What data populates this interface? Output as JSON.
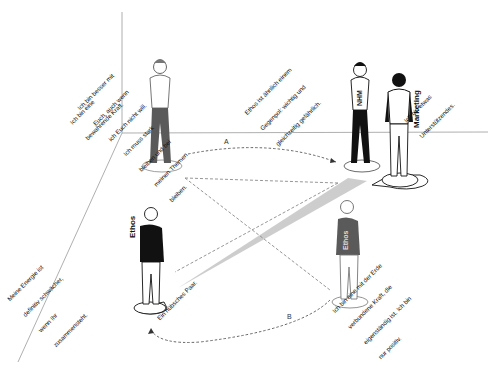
{
  "diagram": {
    "type": "systemic constellation (Aufstellung) with figures on a floor",
    "colors": {
      "background": "#ffffff",
      "room_lines": "#9a9a9a",
      "dashed_lines": "#8a8a8a",
      "gaze_beam": "#c8c8c8",
      "figure_dark": "#111111",
      "figure_grey": "#5a5a5a"
    },
    "figures": [
      {
        "id": "nhm-left",
        "shirt_label": "NHM",
        "color": "grey"
      },
      {
        "id": "nhm-right",
        "shirt_label": "NHM",
        "color": "black"
      },
      {
        "id": "marketing",
        "side_label": "Marketing",
        "color": "black-white"
      },
      {
        "id": "ethos-left",
        "side_label": "Ethos",
        "color": "black"
      },
      {
        "id": "ethos-right",
        "shirt_label": "Ethos",
        "color": "grey"
      }
    ],
    "notes": {
      "left_wall": [
        "Ich bin eine",
        "bewahrende Kraft."
      ],
      "nhm_left": [
        "Ich bin besser mit",
        "Euch, auch wenn",
        "ich Euch nicht will.",
        "Ich muss stark",
        "bleiben und bei",
        "meinen Themen",
        "bleiben."
      ],
      "nhm_right": [
        "Ethos ist ähnlich einem",
        "Gegenpol: wichtig und",
        "gleichzeitig gefährlich."
      ],
      "marketing": [
        "Ich bin etwas",
        "Unterstützendes."
      ],
      "ethos_left": [
        "Meine Energie ist",
        "definitiv schwächer,",
        "wenn Ihr",
        "zusammensteht."
      ],
      "ethos_left_beam": [
        "Ein hübsches Paar."
      ],
      "ethos_right": [
        "Ich bin eine mit der Erde",
        "verbundene Kraft, die",
        "eigenständig ist. Ich bin",
        "nur positiv."
      ]
    },
    "arrows": [
      {
        "label": "A",
        "from": "nhm-left",
        "to": "nhm-right"
      },
      {
        "label": "B",
        "from": "ethos-right",
        "to": "ethos-left"
      }
    ]
  }
}
